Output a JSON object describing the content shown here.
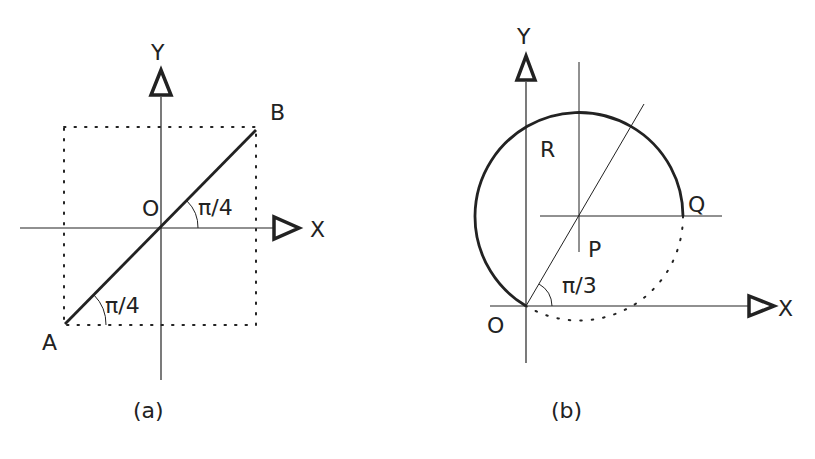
{
  "figure_a": {
    "caption": "(a)",
    "axis_x_label": "X",
    "axis_y_label": "Y",
    "origin_label": "O",
    "point_a_label": "A",
    "point_b_label": "B",
    "angle_at_origin": "π/4",
    "angle_at_a": "π/4"
  },
  "figure_b": {
    "caption": "(b)",
    "axis_x_label": "X",
    "axis_y_label": "Y",
    "origin_label": "O",
    "point_p_label": "P",
    "point_q_label": "Q",
    "point_r_label": "R",
    "angle_at_origin": "π/3"
  },
  "colors": {
    "ink": "#222222",
    "background": "#ffffff"
  }
}
